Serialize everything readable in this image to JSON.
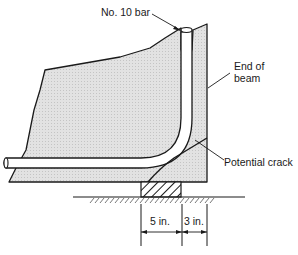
{
  "figure": {
    "type": "reinforcement detail at beam end support",
    "labels": {
      "bar": "No. 10 bar",
      "end_of_beam_line1": "End of",
      "end_of_beam_line2": "beam",
      "crack": "Potential crack",
      "dim_left": "5 in.",
      "dim_right": "3 in."
    },
    "colors": {
      "concrete_fill": "#dcdcdc",
      "line": "#1a1a1a",
      "bar_fill": "#ffffff"
    },
    "dimensions": [
      {
        "label": "5 in.",
        "from": "edge of bearing pad",
        "to": "inside of bar"
      },
      {
        "label": "3 in.",
        "from": "inside of bar",
        "to": "end of beam"
      }
    ]
  }
}
